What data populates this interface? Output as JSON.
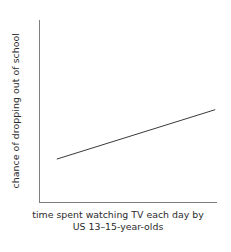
{
  "chart_data": {
    "type": "line",
    "title": "",
    "subtitle": "",
    "xlabel_line1": "time spent watching TV each day by",
    "xlabel_line2": "US 13–15-year-olds",
    "xlabel_full": "time spent watching TV each day by US 13–15-year-olds",
    "ylabel": "chance of dropping out of school",
    "series": [
      {
        "name": "trend",
        "x": [
          0.1,
          0.99
        ],
        "y": [
          0.24,
          0.51
        ],
        "color": "#3a3a3a",
        "linewidth": 1
      }
    ],
    "x": [
      0.1,
      0.99
    ],
    "values": [
      0.24,
      0.51
    ],
    "xlim": [
      0,
      1
    ],
    "ylim": [
      0,
      1
    ],
    "xticks": [],
    "yticks": [],
    "xticklabels": [],
    "yticklabels": [],
    "grid": false,
    "legend": false,
    "legend_position": "none",
    "annotations": [],
    "spines": {
      "left": true,
      "bottom": true,
      "top": false,
      "right": false
    },
    "colors": {
      "background": "#ffffff",
      "axis": "#7d7d7d",
      "line": "#3a3a3a",
      "text": "#2b2b2b"
    }
  }
}
